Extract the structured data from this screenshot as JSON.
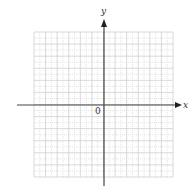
{
  "diagram": {
    "type": "coordinate-plane",
    "x_axis_label": "x",
    "y_axis_label": "y",
    "origin_label": "0",
    "grid": {
      "columns": 12,
      "rows": 12,
      "minor_subdivision": "dotted half-unit lines",
      "major_color": "#cfcfcf",
      "minor_color": "#dcdcdc"
    },
    "axis_color": "#333333"
  }
}
